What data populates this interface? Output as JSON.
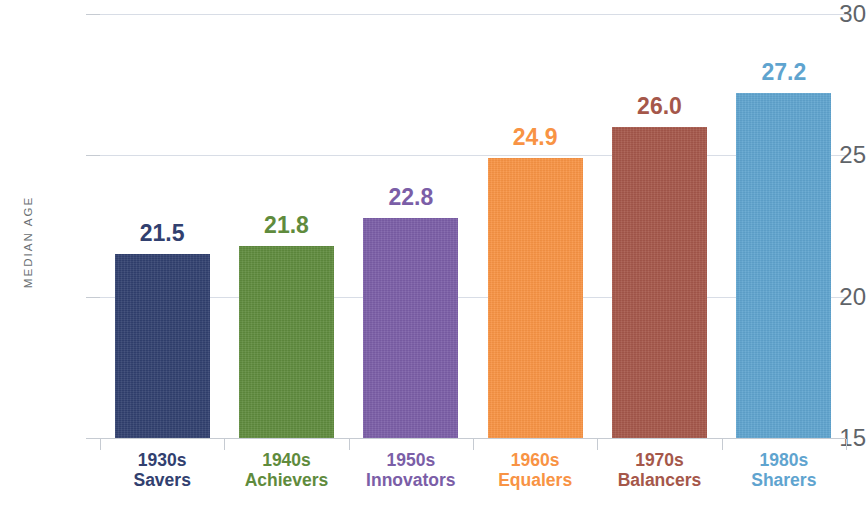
{
  "chart_data": {
    "type": "bar",
    "title": "",
    "subtitle": "",
    "xlabel": "",
    "ylabel": "MEDIAN AGE",
    "ylim": [
      15,
      30
    ],
    "yticks": [
      15,
      20,
      25,
      30
    ],
    "ytick_labels": [
      "15",
      "20",
      "25",
      "30"
    ],
    "grid": true,
    "legend": "none",
    "categories": [
      "1930s Savers",
      "1940s Achievers",
      "1950s Innovators",
      "1960s Equalers",
      "1970s Balancers",
      "1980s Sharers"
    ],
    "values": [
      21.5,
      21.8,
      22.8,
      24.9,
      26.0,
      27.2
    ],
    "value_labels": [
      "21.5",
      "21.8",
      "22.8",
      "24.9",
      "26.0",
      "27.2"
    ],
    "colors": [
      "#31406f",
      "#5f8b3d",
      "#7b5ea7",
      "#f89344",
      "#a5574a",
      "#5fa4cf"
    ]
  },
  "axes": {
    "y_title": "MEDIAN AGE",
    "y_ticks": [
      {
        "label": "30",
        "value": 30
      },
      {
        "label": "25",
        "value": 25
      },
      {
        "label": "20",
        "value": 20
      },
      {
        "label": "15",
        "value": 15
      }
    ]
  },
  "bars": [
    {
      "decade": "1930s",
      "cohort": "Savers",
      "value": 21.5,
      "value_label": "21.5",
      "color": "#31406f"
    },
    {
      "decade": "1940s",
      "cohort": "Achievers",
      "value": 21.8,
      "value_label": "21.8",
      "color": "#5f8b3d"
    },
    {
      "decade": "1950s",
      "cohort": "Innovators",
      "value": 22.8,
      "value_label": "22.8",
      "color": "#7b5ea7"
    },
    {
      "decade": "1960s",
      "cohort": "Equalers",
      "value": 24.9,
      "value_label": "24.9",
      "color": "#f89344"
    },
    {
      "decade": "1970s",
      "cohort": "Balancers",
      "value": 26.0,
      "value_label": "26.0",
      "color": "#a5574a"
    },
    {
      "decade": "1980s",
      "cohort": "Sharers",
      "value": 27.2,
      "value_label": "27.2",
      "color": "#5fa4cf"
    }
  ]
}
